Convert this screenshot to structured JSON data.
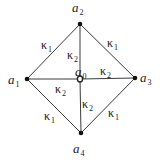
{
  "diagram": {
    "nodes": [
      {
        "id": "a0",
        "base": "a",
        "sub": "0",
        "kind": "center"
      },
      {
        "id": "a1",
        "base": "a",
        "sub": "1",
        "kind": "corner"
      },
      {
        "id": "a2",
        "base": "a",
        "sub": "2",
        "kind": "corner"
      },
      {
        "id": "a3",
        "base": "a",
        "sub": "3",
        "kind": "corner"
      },
      {
        "id": "a4",
        "base": "a",
        "sub": "4",
        "kind": "corner"
      }
    ],
    "edges": [
      {
        "from": "a1",
        "to": "a2",
        "base": "κ",
        "sub": "1"
      },
      {
        "from": "a2",
        "to": "a3",
        "base": "κ",
        "sub": "1"
      },
      {
        "from": "a3",
        "to": "a4",
        "base": "κ",
        "sub": "1"
      },
      {
        "from": "a4",
        "to": "a1",
        "base": "κ",
        "sub": "1"
      },
      {
        "from": "a0",
        "to": "a2",
        "base": "κ",
        "sub": "2"
      },
      {
        "from": "a0",
        "to": "a3",
        "base": "κ",
        "sub": "2"
      },
      {
        "from": "a0",
        "to": "a1",
        "base": "κ",
        "sub": "2"
      },
      {
        "from": "a0",
        "to": "a4",
        "base": "κ",
        "sub": "2"
      }
    ]
  }
}
